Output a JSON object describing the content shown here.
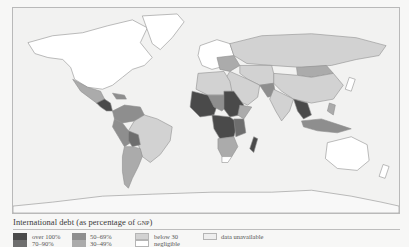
{
  "map": {
    "title": "World map: International debt as percentage of GNP",
    "ocean_color": "#f2f2f1",
    "border_color": "#9a9a9a"
  },
  "legend": {
    "title_main": "International debt (as percentage of ",
    "title_abbr": "gnp",
    "title_end": ")",
    "items": [
      {
        "label": "over 100%",
        "color": "#4a4a4a"
      },
      {
        "label": "70–90%",
        "color": "#6e6e6e"
      },
      {
        "label": "50–69%",
        "color": "#8e8e8e"
      },
      {
        "label": "30–49%",
        "color": "#ababab"
      },
      {
        "label": "below 30",
        "color": "#d2d2d2"
      },
      {
        "label": "negligible",
        "color": "#ffffff"
      },
      {
        "label": "data unavailable",
        "color": "#eeeeee"
      }
    ]
  }
}
